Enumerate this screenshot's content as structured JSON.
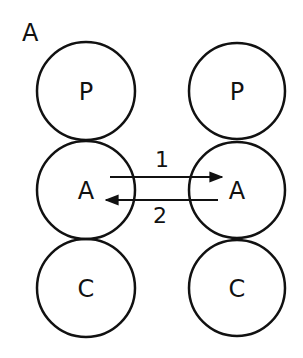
{
  "panel_label": "A",
  "left_column": {
    "circles": [
      {
        "label": "P"
      },
      {
        "label": "A"
      },
      {
        "label": "C"
      }
    ]
  },
  "right_column": {
    "circles": [
      {
        "label": "P"
      },
      {
        "label": "A"
      },
      {
        "label": "C"
      }
    ]
  },
  "arrows": [
    {
      "label": "1",
      "direction": "left-to-right"
    },
    {
      "label": "2",
      "direction": "right-to-left"
    }
  ],
  "colors": {
    "stroke": "#111111",
    "background": "#ffffff"
  }
}
